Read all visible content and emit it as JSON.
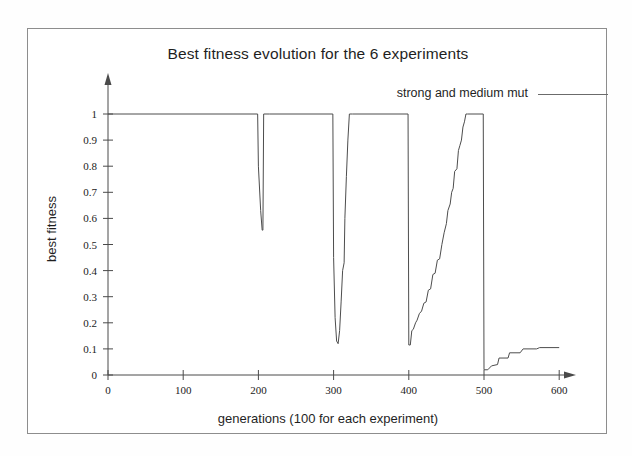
{
  "figure": {
    "title": "Best fitness evolution for the 6 experiments",
    "legend_label": "strong and medium mut",
    "xlabel": "generations (100 for each experiment)",
    "ylabel": "best fitness"
  },
  "chart_data": {
    "type": "line",
    "title": "Best fitness evolution for the 6 experiments",
    "xlabel": "generations (100 for each experiment)",
    "ylabel": "best fitness",
    "xlim": [
      0,
      600
    ],
    "ylim": [
      0,
      1
    ],
    "xticks": [
      0,
      100,
      200,
      300,
      400,
      500,
      600
    ],
    "xtick_labels": [
      "0",
      "100",
      "200",
      "300",
      "400",
      "500",
      "600"
    ],
    "yticks": [
      0,
      0.1,
      0.2,
      0.3,
      0.4,
      0.5,
      0.6,
      0.7,
      0.8,
      0.9,
      1
    ],
    "ytick_labels": [
      "0",
      "0.1",
      "0.2",
      "0.3",
      "0.4",
      "0.5",
      "0.6",
      "0.7",
      "0.8",
      "0.9",
      "1"
    ],
    "grid": false,
    "legend_position": "top-right",
    "line_color": "#4d4d4d",
    "series": [
      {
        "name": "strong and medium mut",
        "points": [
          [
            0,
            1.0
          ],
          [
            199,
            1.0
          ],
          [
            200,
            0.8
          ],
          [
            203,
            0.63
          ],
          [
            205,
            0.555
          ],
          [
            206,
            0.555
          ],
          [
            207,
            1.0
          ],
          [
            215,
            1.0
          ],
          [
            299,
            1.0
          ],
          [
            300,
            0.45
          ],
          [
            302,
            0.22
          ],
          [
            304,
            0.13
          ],
          [
            306,
            0.12
          ],
          [
            308,
            0.17
          ],
          [
            310,
            0.28
          ],
          [
            312,
            0.4
          ],
          [
            314,
            0.43
          ],
          [
            315,
            0.6
          ],
          [
            317,
            0.76
          ],
          [
            319,
            0.9
          ],
          [
            321,
            1.0
          ],
          [
            325,
            1.0
          ],
          [
            399,
            1.0
          ],
          [
            400,
            0.115
          ],
          [
            402,
            0.115
          ],
          [
            404,
            0.17
          ],
          [
            406,
            0.175
          ],
          [
            409,
            0.2
          ],
          [
            411,
            0.21
          ],
          [
            414,
            0.235
          ],
          [
            417,
            0.245
          ],
          [
            420,
            0.275
          ],
          [
            423,
            0.28
          ],
          [
            426,
            0.325
          ],
          [
            429,
            0.33
          ],
          [
            432,
            0.385
          ],
          [
            435,
            0.39
          ],
          [
            438,
            0.44
          ],
          [
            441,
            0.445
          ],
          [
            444,
            0.5
          ],
          [
            447,
            0.545
          ],
          [
            450,
            0.58
          ],
          [
            452,
            0.63
          ],
          [
            455,
            0.655
          ],
          [
            457,
            0.7
          ],
          [
            459,
            0.715
          ],
          [
            461,
            0.78
          ],
          [
            464,
            0.79
          ],
          [
            466,
            0.86
          ],
          [
            468,
            0.88
          ],
          [
            470,
            0.9
          ],
          [
            472,
            0.95
          ],
          [
            474,
            0.97
          ],
          [
            476,
            1.0
          ],
          [
            478,
            1.0
          ],
          [
            499,
            1.0
          ],
          [
            500,
            0.02
          ],
          [
            505,
            0.02
          ],
          [
            510,
            0.035
          ],
          [
            518,
            0.04
          ],
          [
            520,
            0.065
          ],
          [
            532,
            0.065
          ],
          [
            534,
            0.085
          ],
          [
            548,
            0.085
          ],
          [
            552,
            0.1
          ],
          [
            570,
            0.1
          ],
          [
            574,
            0.105
          ],
          [
            600,
            0.105
          ]
        ]
      }
    ]
  }
}
